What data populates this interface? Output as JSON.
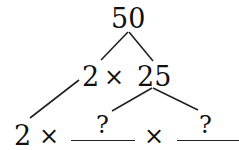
{
  "tree": {
    "root": "50",
    "level1": {
      "left": "2",
      "operator": "×",
      "right": "25"
    },
    "level2": {
      "factor": "2",
      "operator1": "×",
      "blank1_answer": "?",
      "operator2": "×",
      "blank2_answer": "?"
    }
  },
  "colors": {
    "ink": "#111111",
    "background": "#ffffff"
  }
}
